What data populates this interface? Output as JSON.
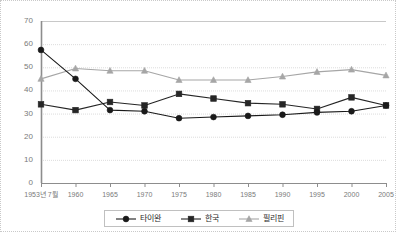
{
  "chart_data": {
    "type": "line",
    "title": "",
    "xlabel": "",
    "ylabel": "",
    "grid": true,
    "legend_position": "bottom",
    "ylim": [
      0,
      70
    ],
    "yticks": [
      0,
      10,
      20,
      30,
      40,
      50,
      60,
      70
    ],
    "categories": [
      "1953년 7월",
      "1960",
      "1965",
      "1970",
      "1975",
      "1980",
      "1985",
      "1990",
      "1995",
      "2000",
      "2005"
    ],
    "series": [
      {
        "name": "타이완",
        "marker": "circle",
        "color": "#1a1a1a",
        "values": [
          57.5,
          45.0,
          31.5,
          31.0,
          28.0,
          28.5,
          29.0,
          29.5,
          30.5,
          31.0,
          33.5
        ]
      },
      {
        "name": "한국",
        "marker": "square",
        "color": "#262626",
        "values": [
          34.0,
          31.5,
          35.0,
          33.5,
          38.5,
          36.5,
          34.5,
          34.0,
          32.0,
          37.0,
          33.5
        ]
      },
      {
        "name": "필리핀",
        "marker": "triangle",
        "color": "#a6a6a6",
        "values": [
          45.0,
          49.5,
          48.5,
          48.5,
          44.5,
          44.5,
          44.5,
          46.0,
          48.0,
          49.0,
          46.5
        ]
      }
    ]
  },
  "legend": {
    "items": [
      {
        "label": "타이완"
      },
      {
        "label": "한국"
      },
      {
        "label": "필리핀"
      }
    ]
  }
}
